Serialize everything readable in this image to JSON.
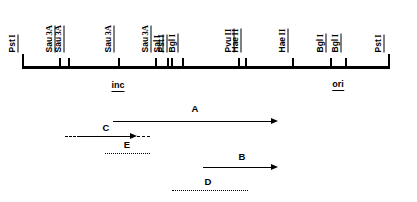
{
  "map": {
    "axis_start_px": 22,
    "axis_end_px": 388,
    "sites": [
      {
        "enzyme": "Pst",
        "numeral": "I",
        "x": 22,
        "height": "tall"
      },
      {
        "enzyme": "Sau",
        "numeral": "3A",
        "x": 59,
        "height": "short"
      },
      {
        "enzyme": "Sau",
        "numeral": "3A",
        "x": 68,
        "height": "short"
      },
      {
        "enzyme": "Sau",
        "numeral": "3A",
        "x": 118,
        "height": "short"
      },
      {
        "enzyme": "Sau",
        "numeral": "3A",
        "x": 155,
        "height": "short"
      },
      {
        "enzyme": "Sal",
        "numeral": "I",
        "x": 167,
        "height": "short"
      },
      {
        "enzyme": "Pst",
        "numeral": "I",
        "x": 171,
        "height": "short"
      },
      {
        "enzyme": "Bgl",
        "numeral": "I",
        "x": 182,
        "height": "short"
      },
      {
        "enzyme": "Pvu",
        "numeral": "II",
        "x": 238,
        "height": "short"
      },
      {
        "enzyme": "Hae",
        "numeral": "II",
        "x": 245,
        "height": "short"
      },
      {
        "enzyme": "Hae",
        "numeral": "II",
        "x": 292,
        "height": "short"
      },
      {
        "enzyme": "Bgl",
        "numeral": "I",
        "x": 330,
        "height": "short"
      },
      {
        "enzyme": "Bgl",
        "numeral": "I",
        "x": 345,
        "height": "short"
      },
      {
        "enzyme": "Pst",
        "numeral": "I",
        "x": 388,
        "height": "tall"
      }
    ],
    "label_positions_px": [
      18,
      55,
      64,
      114,
      151,
      163,
      167,
      178,
      234,
      241,
      288,
      326,
      341,
      384
    ],
    "label_baseline_y_px": 52
  },
  "regions": [
    {
      "name": "inc",
      "x": 118,
      "y": 80
    },
    {
      "name": "ori",
      "x": 338,
      "y": 79
    }
  ],
  "transcripts": [
    {
      "id": "A",
      "label": "A",
      "label_x": 195,
      "label_y": 104,
      "line_y": 121,
      "segments": [
        {
          "style": "solid",
          "x1": 113,
          "x2": 272
        }
      ],
      "arrowhead": {
        "x": 271,
        "y": 117.5
      }
    },
    {
      "id": "C",
      "label": "C",
      "label_x": 106,
      "label_y": 123,
      "line_y": 136,
      "segments": [
        {
          "style": "dashed",
          "x1": 65,
          "x2": 80
        },
        {
          "style": "solid",
          "x1": 80,
          "x2": 131
        },
        {
          "style": "dashed",
          "x1": 137,
          "x2": 150
        }
      ],
      "arrowhead": {
        "x": 130,
        "y": 132.5
      }
    },
    {
      "id": "E",
      "label": "E",
      "label_x": 127,
      "label_y": 140,
      "line_y": 153,
      "segments": [
        {
          "style": "dotted",
          "x1": 105,
          "x2": 150
        }
      ],
      "arrowhead": null
    },
    {
      "id": "B",
      "label": "B",
      "label_x": 242,
      "label_y": 152,
      "line_y": 167,
      "segments": [
        {
          "style": "solid",
          "x1": 203,
          "x2": 272
        }
      ],
      "arrowhead": {
        "x": 271,
        "y": 163.5
      }
    },
    {
      "id": "D",
      "label": "D",
      "label_x": 208,
      "label_y": 177,
      "line_y": 190,
      "segments": [
        {
          "style": "dotted",
          "x1": 172,
          "x2": 248
        }
      ],
      "arrowhead": null
    }
  ],
  "colors": {
    "ink": "#000000",
    "background": "#ffffff"
  }
}
